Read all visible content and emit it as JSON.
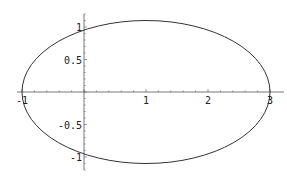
{
  "chart_data": {
    "type": "line",
    "title": "",
    "xlabel": "",
    "ylabel": "",
    "series": [
      {
        "name": "ellipse",
        "center": [
          1,
          0
        ],
        "rx": 2,
        "ry": 1.1,
        "x_extent": [
          -1,
          3
        ],
        "y_extent": [
          -1.1,
          1.1
        ]
      }
    ],
    "xlim": [
      -1.1,
      3.2
    ],
    "ylim": [
      -1.2,
      1.2
    ],
    "x_ticks": [
      {
        "value": -1,
        "label": "-1"
      },
      {
        "value": 1,
        "label": "1"
      },
      {
        "value": 2,
        "label": "2"
      },
      {
        "value": 3,
        "label": "3"
      }
    ],
    "y_ticks": [
      {
        "value": 1,
        "label": "1"
      },
      {
        "value": 0.5,
        "label": "0.5"
      },
      {
        "value": -0.5,
        "label": "-0.5"
      },
      {
        "value": -1,
        "label": "-1"
      }
    ],
    "grid": false,
    "legend": null,
    "axes_origin": [
      0,
      0
    ]
  },
  "colors": {
    "curve": "#333333",
    "axis": "#555555",
    "background": "#ffffff"
  }
}
